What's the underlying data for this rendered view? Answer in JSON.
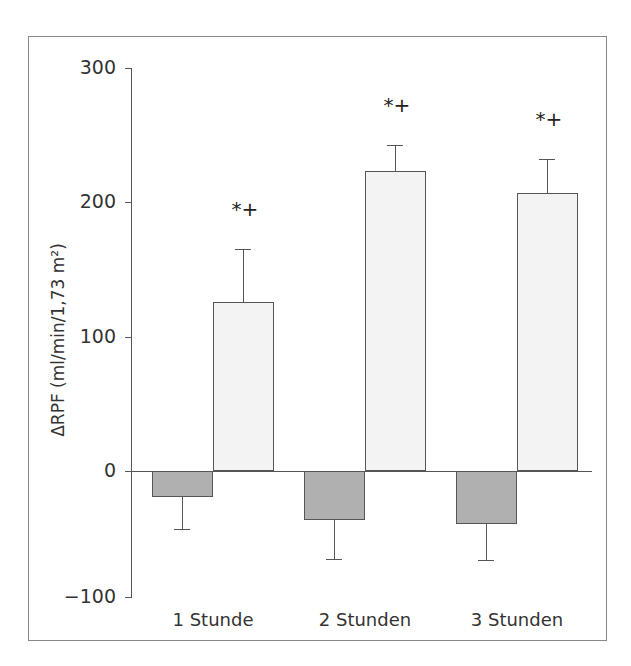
{
  "chart_data": {
    "type": "bar",
    "title": "",
    "xlabel": "",
    "ylabel": "ΔRPF (ml/min/1,73 m²)",
    "ylim": [
      -100,
      300
    ],
    "yticks": [
      300,
      200,
      100,
      0,
      -100
    ],
    "ytick_labels": [
      "300",
      "200",
      "100",
      "0",
      "−100"
    ],
    "categories": [
      "1 Stunde",
      "2 Stunden",
      "3 Stunden"
    ],
    "series": [
      {
        "name": "Gruppe A (dunkel)",
        "color": "#b0b0b0",
        "values": [
          -21,
          -39,
          -42
        ],
        "error": [
          25,
          31,
          29
        ]
      },
      {
        "name": "Gruppe B (hell)",
        "color": "#f3f3f3",
        "values": [
          126,
          223,
          207
        ],
        "error": [
          39,
          20,
          25
        ]
      }
    ],
    "annotations": [
      "*+",
      "*+",
      "*+"
    ],
    "grid": false,
    "legend": "none"
  }
}
